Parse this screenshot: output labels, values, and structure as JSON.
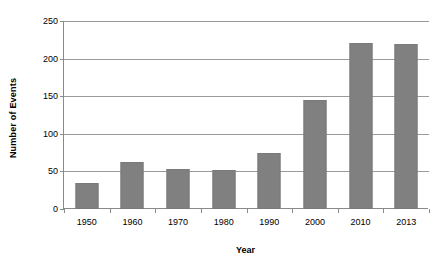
{
  "chart_data": {
    "type": "bar",
    "title": "",
    "xlabel": "Year",
    "ylabel": "Number of Events",
    "categories": [
      "1950",
      "1960",
      "1970",
      "1980",
      "1990",
      "2000",
      "2010",
      "2013"
    ],
    "values": [
      34,
      62,
      53,
      52,
      74,
      145,
      221,
      219
    ],
    "series": [
      {
        "name": "Number of Events",
        "values": [
          34,
          62,
          53,
          52,
          74,
          145,
          221,
          219
        ]
      }
    ],
    "ylim": [
      0,
      250
    ],
    "yticks": [
      0,
      50,
      100,
      150,
      200,
      250
    ],
    "ytick_labels": [
      "0",
      "50",
      "100",
      "150",
      "200",
      "250"
    ],
    "grid": true,
    "legend": false,
    "colors": {
      "bar": "#808080",
      "bar_border": "#7a7a7a",
      "gridline": "#9a9a9a",
      "axis": "#8a8a8a",
      "text": "#000000",
      "background": "#ffffff"
    }
  }
}
